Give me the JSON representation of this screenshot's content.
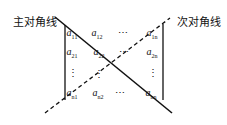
{
  "labels": {
    "main_diagonal": "主对角线",
    "anti_diagonal": "次对角线"
  },
  "matrix": {
    "rows": [
      [
        {
          "base": "a",
          "sub": "11"
        },
        {
          "base": "a",
          "sub": "12"
        },
        {
          "dots": "⋯"
        },
        {
          "base": "a",
          "sub": "1n"
        }
      ],
      [
        {
          "base": "a",
          "sub": "21"
        },
        {
          "base": "a",
          "sub": "22"
        },
        {
          "dots": "⋯"
        },
        {
          "base": "a",
          "sub": "2n"
        }
      ],
      [
        {
          "dots": "⋮"
        },
        {
          "dots": "⋮"
        },
        {
          "dots": ""
        },
        {
          "dots": "⋮"
        }
      ],
      [
        {
          "base": "a",
          "sub": "n1"
        },
        {
          "base": "a",
          "sub": "n2"
        },
        {
          "dots": "⋯"
        },
        {
          "base": "a",
          "sub": "nn"
        }
      ]
    ]
  },
  "colors": {
    "line": "#111111",
    "background": "#ffffff"
  }
}
